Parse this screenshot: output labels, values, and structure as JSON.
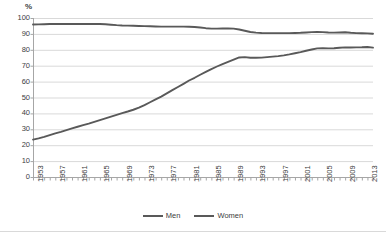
{
  "chart_data": {
    "type": "line",
    "title": "",
    "subtitle": "",
    "xlabel": "",
    "ylabel": "%",
    "ylim": [
      0,
      100
    ],
    "ytick_step": 10,
    "grid": true,
    "grid_orientation": "horizontal",
    "legend_position": "bottom",
    "yticks": [
      "100",
      "90",
      "80",
      "70",
      "60",
      "50",
      "40",
      "30",
      "20",
      "10",
      "0"
    ],
    "xticks_visible": [
      "1953",
      "1957",
      "1961",
      "1965",
      "1969",
      "1973",
      "1977",
      "1981",
      "1985",
      "1989",
      "1993",
      "1997",
      "2001",
      "2005",
      "2009",
      "2013"
    ],
    "x": [
      1953,
      1954,
      1955,
      1956,
      1957,
      1958,
      1959,
      1960,
      1961,
      1962,
      1963,
      1964,
      1965,
      1966,
      1967,
      1968,
      1969,
      1970,
      1971,
      1972,
      1973,
      1974,
      1975,
      1976,
      1977,
      1978,
      1979,
      1980,
      1981,
      1982,
      1983,
      1984,
      1985,
      1986,
      1987,
      1988,
      1989,
      1990,
      1991,
      1992,
      1993,
      1994,
      1995,
      1996,
      1997,
      1998,
      1999,
      2000,
      2001,
      2002,
      2003,
      2004,
      2005,
      2006,
      2007,
      2008,
      2009,
      2010,
      2011,
      2012,
      2013,
      2014
    ],
    "series": [
      {
        "name": "Men",
        "color": "#595959",
        "values": [
          23.5,
          24.3,
          25.2,
          26.3,
          27.4,
          28.4,
          29.5,
          30.6,
          31.6,
          32.6,
          33.6,
          34.7,
          35.8,
          36.9,
          38.0,
          39.1,
          40.2,
          41.2,
          42.3,
          43.6,
          45.2,
          47.0,
          48.8,
          50.6,
          52.6,
          54.6,
          56.6,
          58.6,
          60.7,
          62.4,
          64.3,
          66.1,
          67.9,
          69.5,
          71.0,
          72.4,
          73.8,
          75.2,
          75.4,
          75.0,
          75.0,
          75.1,
          75.4,
          75.7,
          76.0,
          76.5,
          77.1,
          77.8,
          78.5,
          79.4,
          80.2,
          80.9,
          81.0,
          80.9,
          81.0,
          81.3,
          81.5,
          81.4,
          81.5,
          81.6,
          81.8,
          81.4
        ]
      },
      {
        "name": "Women",
        "color": "#595959",
        "values": [
          95.9,
          96.0,
          96.1,
          96.2,
          96.2,
          96.2,
          96.2,
          96.2,
          96.2,
          96.2,
          96.2,
          96.2,
          96.2,
          96.1,
          95.8,
          95.5,
          95.3,
          95.2,
          95.1,
          95.0,
          94.9,
          94.8,
          94.7,
          94.6,
          94.6,
          94.6,
          94.6,
          94.6,
          94.5,
          94.3,
          94.0,
          93.6,
          93.3,
          93.3,
          93.4,
          93.5,
          93.3,
          92.8,
          92.0,
          91.2,
          90.8,
          90.6,
          90.5,
          90.5,
          90.5,
          90.5,
          90.5,
          90.6,
          90.7,
          90.9,
          91.1,
          91.2,
          91.1,
          90.9,
          90.8,
          90.9,
          91.0,
          90.7,
          90.5,
          90.4,
          90.3,
          90.1
        ]
      }
    ],
    "legend": [
      {
        "label": "Men",
        "color": "#595959"
      },
      {
        "label": "Women",
        "color": "#595959"
      }
    ],
    "colors": {
      "line": "#595959",
      "grid": "#d9d9d9",
      "axis": "#a6a6a6",
      "text": "#404040",
      "background": "#ffffff",
      "border": "#d9d9d9"
    }
  }
}
